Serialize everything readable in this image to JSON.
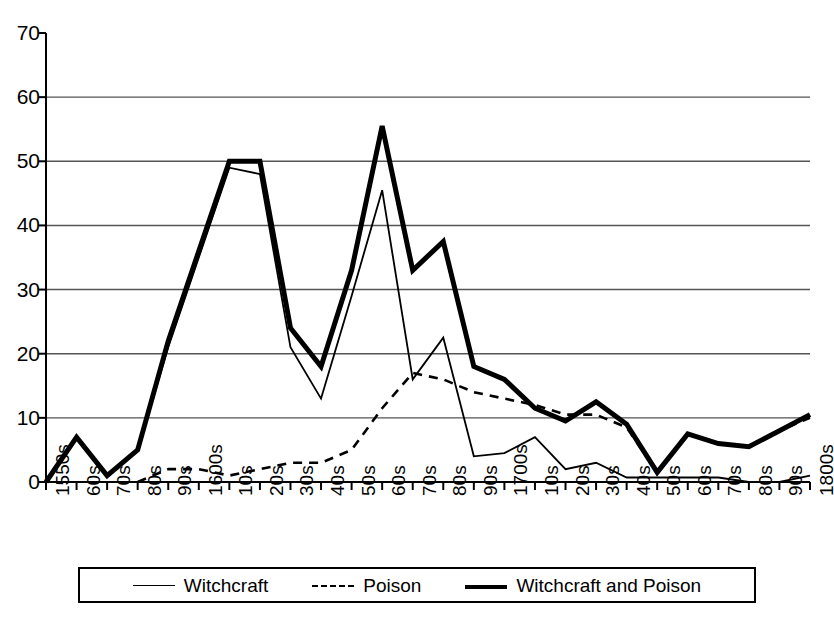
{
  "chart_data": {
    "type": "line",
    "title": "",
    "xlabel": "",
    "ylabel": "",
    "ylim": [
      0,
      70
    ],
    "yticks": [
      0,
      10,
      20,
      30,
      40,
      50,
      60,
      70
    ],
    "grid": true,
    "legend_position": "bottom",
    "categories": [
      "1550s",
      "60s",
      "70s",
      "80s",
      "90s",
      "1600s",
      "10s",
      "20s",
      "30s",
      "40s",
      "50s",
      "60s",
      "70s",
      "80s",
      "90s",
      "1700s",
      "10s",
      "20s",
      "30s",
      "40s",
      "50s",
      "60s",
      "70s",
      "80s",
      "90s",
      "1800s"
    ],
    "series": [
      {
        "name": "Witchcraft",
        "style": "thin-solid",
        "color": "#000000",
        "values": [
          0,
          7,
          1,
          5,
          21,
          35,
          49,
          48,
          21,
          13,
          29,
          45.5,
          16,
          22.5,
          4,
          4.5,
          7,
          2,
          3,
          0.7,
          0.7,
          0.7,
          0.7,
          0,
          0,
          1
        ]
      },
      {
        "name": "Poison",
        "style": "dashed",
        "color": "#000000",
        "values": [
          null,
          null,
          null,
          0,
          2,
          2,
          1,
          2,
          3,
          3,
          5,
          11.5,
          17,
          16,
          14,
          13,
          12,
          10.5,
          10.5,
          8.5,
          1.5,
          7.5,
          6,
          5.5,
          8,
          10
        ]
      },
      {
        "name": "Witchcraft and Poison",
        "style": "thick-solid",
        "color": "#000000",
        "values": [
          0,
          7,
          1,
          5,
          22,
          36,
          50,
          50,
          24,
          18,
          33,
          55.5,
          33,
          37.5,
          18,
          16,
          11.5,
          9.5,
          12.5,
          9,
          1.5,
          7.5,
          6,
          5.5,
          8,
          10.5
        ]
      }
    ]
  },
  "legend": {
    "items": [
      {
        "label": "Witchcraft",
        "style": "thin-solid"
      },
      {
        "label": "Poison",
        "style": "dashed"
      },
      {
        "label": "Witchcraft and Poison",
        "style": "thick-solid"
      }
    ]
  },
  "axis": {
    "y_labels": [
      "70",
      "60",
      "50",
      "40",
      "30",
      "20",
      "10",
      "0"
    ],
    "x_labels": [
      "1550s",
      "60s",
      "70s",
      "80s",
      "90s",
      "1600s",
      "10s",
      "20s",
      "30s",
      "40s",
      "50s",
      "60s",
      "70s",
      "80s",
      "90s",
      "1700s",
      "10s",
      "20s",
      "30s",
      "40s",
      "50s",
      "60s",
      "70s",
      "80s",
      "90s",
      "1800s"
    ]
  }
}
